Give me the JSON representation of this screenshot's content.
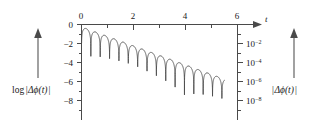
{
  "figure": {
    "background_color": "#ffffff",
    "axis_color": "#4a4a4a",
    "curve_color": "#4d4d4d"
  },
  "left_annotation": {
    "arrow_icon": "up-arrow-icon",
    "label": "log",
    "label_body": "Δϕ(t)",
    "bar": "|"
  },
  "right_annotation": {
    "arrow_icon": "up-arrow-icon",
    "label_body": "Δϕ(t)",
    "bar": "|"
  },
  "chart_data": {
    "type": "line",
    "title": "",
    "xlabel": "t",
    "ylabel": "log |Δϕ(t)|",
    "ylabel_right": "|Δϕ(t)|",
    "xlim": [
      0,
      6
    ],
    "ylim": [
      -9,
      0.4
    ],
    "grid": false,
    "legend": null,
    "x_axis_position": "top",
    "x_ticks": [
      0,
      2,
      4,
      6
    ],
    "x_ticklabels": [
      "0",
      "2",
      "4",
      "6"
    ],
    "x_minor_ticks": [
      1,
      3,
      5
    ],
    "y_ticks": [
      0,
      -2,
      -4,
      -6,
      -8
    ],
    "y_ticklabels": [
      "0",
      "−2",
      "−4",
      "−6",
      "−8"
    ],
    "y_minor_ticks": [
      -1,
      -3,
      -5,
      -7
    ],
    "y_right_ticks": [
      -2,
      -4,
      -6,
      -8
    ],
    "y_right_ticklabels": [
      "10−2",
      "10−4",
      "10−6",
      "10−8"
    ],
    "y_right_mantissa": [
      "10",
      "10",
      "10",
      "10"
    ],
    "y_right_exponents": [
      "−2",
      "−4",
      "−6",
      "−8"
    ],
    "envelope_slope_per_unit_t": -1.0,
    "envelope_intercept": -0.25,
    "oscillation_period_t": 0.36,
    "curve_start_t": 0.0,
    "curve_end_t": 5.5,
    "cusp_depth_log": 3.2,
    "x": [
      0.0,
      0.18,
      0.36,
      0.54,
      0.72,
      0.9,
      1.08,
      1.26,
      1.44,
      1.62,
      1.8,
      1.98,
      2.16,
      2.34,
      2.52,
      2.7,
      2.88,
      3.06,
      3.24,
      3.42,
      3.6,
      3.78,
      3.96,
      4.14,
      4.32,
      4.5,
      4.68,
      4.86,
      5.04,
      5.22,
      5.4
    ],
    "y_peaks": [
      -0.25,
      -0.43,
      -0.61,
      -0.79,
      -0.97,
      -1.15,
      -1.33,
      -1.51,
      -1.69,
      -1.87,
      -2.05,
      -2.23,
      -2.41,
      -2.59,
      -2.77,
      -2.95,
      -3.13,
      -3.31,
      -3.49,
      -3.67,
      -3.85,
      -4.03,
      -4.21,
      -4.39,
      -4.57,
      -4.75,
      -4.93,
      -5.11,
      -5.29,
      -5.47,
      -5.65
    ]
  }
}
